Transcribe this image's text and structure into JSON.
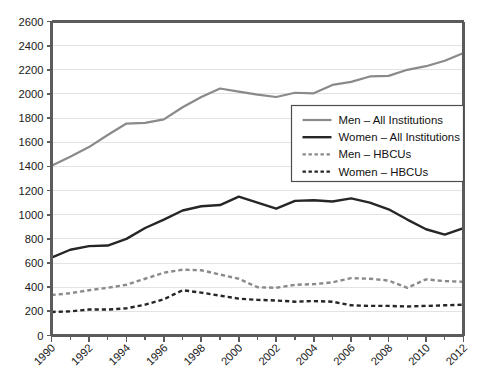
{
  "chart_data": {
    "type": "line",
    "title": "",
    "subtitle": "",
    "xlabel": "",
    "ylabel": "",
    "xlim": [
      1990,
      2012
    ],
    "ylim": [
      0,
      2600
    ],
    "y_ticks": [
      0,
      200,
      400,
      600,
      800,
      1000,
      1200,
      1400,
      1600,
      1800,
      2000,
      2200,
      2400,
      2600
    ],
    "x_ticks_major": [
      1990,
      1992,
      1994,
      1996,
      1998,
      2000,
      2002,
      2004,
      2006,
      2008,
      2010,
      2012
    ],
    "x_ticks_minor": [
      1991,
      1993,
      1995,
      1997,
      1999,
      2001,
      2003,
      2005,
      2007,
      2009,
      2011
    ],
    "grid": true,
    "grid_axis": "y",
    "legend_position": "center-right",
    "x": [
      1990,
      1991,
      1992,
      1993,
      1994,
      1995,
      1996,
      1997,
      1998,
      1999,
      2000,
      2001,
      2002,
      2003,
      2004,
      2005,
      2006,
      2007,
      2008,
      2009,
      2010,
      2011,
      2012
    ],
    "series": [
      {
        "name": "Men – All Institutions",
        "style": "solid",
        "color": "#8a8a8a",
        "width": 2.2,
        "values": [
          1405,
          1480,
          1560,
          1660,
          1755,
          1760,
          1790,
          1890,
          1975,
          2045,
          2020,
          1995,
          1975,
          2010,
          2005,
          2075,
          2100,
          2145,
          2150,
          2200,
          2230,
          2275,
          2340
        ]
      },
      {
        "name": "Women – All Institutions",
        "style": "solid",
        "color": "#262626",
        "width": 2.4,
        "values": [
          645,
          710,
          740,
          745,
          800,
          890,
          960,
          1035,
          1070,
          1080,
          1150,
          1100,
          1050,
          1115,
          1120,
          1110,
          1135,
          1100,
          1045,
          960,
          880,
          835,
          890
        ]
      },
      {
        "name": "Men – HBCUs",
        "style": "dotted",
        "color": "#8a8a8a",
        "width": 2.4,
        "values": [
          335,
          350,
          375,
          395,
          420,
          470,
          520,
          545,
          540,
          505,
          470,
          400,
          395,
          420,
          425,
          440,
          475,
          470,
          455,
          395,
          465,
          450,
          445
        ]
      },
      {
        "name": "Women – HBCUs",
        "style": "dotted",
        "color": "#262626",
        "width": 2.4,
        "values": [
          195,
          200,
          215,
          215,
          225,
          255,
          300,
          375,
          355,
          330,
          305,
          295,
          290,
          280,
          285,
          280,
          250,
          245,
          245,
          240,
          245,
          250,
          255
        ]
      }
    ]
  },
  "legend": {
    "items": [
      {
        "label": "Men – All Institutions"
      },
      {
        "label": "Women – All Institutions"
      },
      {
        "label": "Men – HBCUs"
      },
      {
        "label": "Women – HBCUs"
      }
    ]
  },
  "axes": {
    "y_tick_labels": [
      "2600",
      "2400",
      "2200",
      "2000",
      "1800",
      "1600",
      "1400",
      "1200",
      "1000",
      "800",
      "600",
      "400",
      "200",
      "0"
    ],
    "x_tick_labels": [
      "1990",
      "1992",
      "1994",
      "1996",
      "1998",
      "2000",
      "2002",
      "2004",
      "2006",
      "2008",
      "2010",
      "2012"
    ]
  }
}
